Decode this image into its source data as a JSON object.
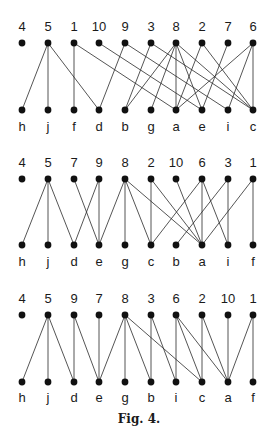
{
  "figure": {
    "caption": "Fig. 4.",
    "node_x": [
      22,
      48,
      74,
      99,
      125,
      151,
      176,
      202,
      228,
      253
    ],
    "graphs": [
      {
        "id": "graph-1",
        "top_y": 43,
        "bottom_y": 110,
        "top_label_y": 31,
        "bottom_label_y": 131,
        "top_labels": [
          "4",
          "5",
          "1",
          "10",
          "9",
          "3",
          "8",
          "2",
          "7",
          "6"
        ],
        "bottom_labels": [
          "h",
          "j",
          "f",
          "d",
          "b",
          "g",
          "a",
          "e",
          "i",
          "c"
        ],
        "edges": [
          [
            "5",
            "h"
          ],
          [
            "5",
            "j"
          ],
          [
            "5",
            "d"
          ],
          [
            "1",
            "f"
          ],
          [
            "1",
            "a"
          ],
          [
            "10",
            "e"
          ],
          [
            "9",
            "d"
          ],
          [
            "9",
            "i"
          ],
          [
            "3",
            "b"
          ],
          [
            "3",
            "c"
          ],
          [
            "8",
            "b"
          ],
          [
            "8",
            "g"
          ],
          [
            "8",
            "a"
          ],
          [
            "8",
            "e"
          ],
          [
            "8",
            "c"
          ],
          [
            "2",
            "a"
          ],
          [
            "2",
            "c"
          ],
          [
            "7",
            "e"
          ],
          [
            "6",
            "a"
          ],
          [
            "6",
            "i"
          ],
          [
            "6",
            "c"
          ]
        ]
      },
      {
        "id": "graph-2",
        "top_y": 179,
        "bottom_y": 245,
        "top_label_y": 167,
        "bottom_label_y": 266,
        "top_labels": [
          "4",
          "5",
          "7",
          "9",
          "8",
          "2",
          "10",
          "6",
          "3",
          "1"
        ],
        "bottom_labels": [
          "h",
          "j",
          "d",
          "e",
          "g",
          "c",
          "b",
          "a",
          "i",
          "f"
        ],
        "edges": [
          [
            "5",
            "h"
          ],
          [
            "5",
            "j"
          ],
          [
            "5",
            "d"
          ],
          [
            "7",
            "e"
          ],
          [
            "9",
            "d"
          ],
          [
            "9",
            "e"
          ],
          [
            "8",
            "e"
          ],
          [
            "8",
            "g"
          ],
          [
            "8",
            "c"
          ],
          [
            "8",
            "a"
          ],
          [
            "2",
            "c"
          ],
          [
            "2",
            "a"
          ],
          [
            "10",
            "a"
          ],
          [
            "6",
            "c"
          ],
          [
            "6",
            "a"
          ],
          [
            "6",
            "i"
          ],
          [
            "3",
            "b"
          ],
          [
            "3",
            "i"
          ],
          [
            "1",
            "a"
          ],
          [
            "1",
            "f"
          ]
        ]
      },
      {
        "id": "graph-3",
        "top_y": 315,
        "bottom_y": 382,
        "top_label_y": 303,
        "bottom_label_y": 402,
        "top_labels": [
          "4",
          "5",
          "9",
          "7",
          "8",
          "3",
          "6",
          "2",
          "10",
          "1"
        ],
        "bottom_labels": [
          "h",
          "j",
          "d",
          "e",
          "g",
          "b",
          "i",
          "c",
          "a",
          "f"
        ],
        "edges": [
          [
            "5",
            "h"
          ],
          [
            "5",
            "j"
          ],
          [
            "5",
            "d"
          ],
          [
            "9",
            "d"
          ],
          [
            "9",
            "e"
          ],
          [
            "7",
            "e"
          ],
          [
            "8",
            "e"
          ],
          [
            "8",
            "g"
          ],
          [
            "8",
            "b"
          ],
          [
            "8",
            "c"
          ],
          [
            "3",
            "b"
          ],
          [
            "3",
            "i"
          ],
          [
            "6",
            "i"
          ],
          [
            "6",
            "c"
          ],
          [
            "6",
            "a"
          ],
          [
            "2",
            "c"
          ],
          [
            "2",
            "a"
          ],
          [
            "10",
            "a"
          ],
          [
            "1",
            "a"
          ],
          [
            "1",
            "f"
          ]
        ]
      }
    ]
  }
}
